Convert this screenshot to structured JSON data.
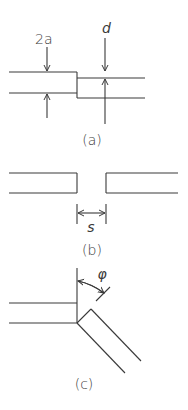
{
  "figure": {
    "panels": [
      {
        "id": "a",
        "caption": "(a)",
        "description": "Step discontinuity between two waveguides with vertical offset",
        "labels": {
          "width": "2a",
          "offset": "d"
        }
      },
      {
        "id": "b",
        "caption": "(b)",
        "description": "Gap between two collinear waveguides",
        "labels": {
          "gap": "s"
        }
      },
      {
        "id": "c",
        "caption": "(c)",
        "description": "Angled junction (bend) between two waveguides",
        "labels": {
          "angle": "φ"
        }
      }
    ],
    "colors": {
      "line": "#3a3a3a",
      "background": "#ffffff"
    }
  }
}
